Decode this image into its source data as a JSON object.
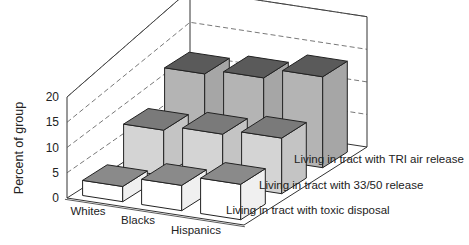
{
  "chart_data": {
    "type": "bar",
    "subtype": "3d-grouped-bar",
    "title": "",
    "xlabel": "",
    "ylabel": "Percent of group",
    "ylim": [
      0,
      20
    ],
    "yticks": [
      "0",
      "5",
      "10",
      "15",
      "20"
    ],
    "grid": true,
    "categories": [
      "Whites",
      "Blacks",
      "Hispanics"
    ],
    "series": [
      {
        "name": "Living in tract with toxic disposal",
        "values": [
          3,
          5,
          7
        ]
      },
      {
        "name": "Living in tract with 33/50 release",
        "values": [
          9,
          10,
          11
        ]
      },
      {
        "name": "Living in tract with TRI air release",
        "values": [
          15,
          16,
          18
        ]
      }
    ],
    "legend_position": "depth-axis labels (right)"
  },
  "colors": {
    "front_face": [
      "#ffffff",
      "#d4d4d4",
      "#b4b4b4"
    ],
    "top_face": [
      "#8a8a8a",
      "#7a7a7a",
      "#5a5a5a"
    ],
    "side_face": [
      "#f0f0f0",
      "#c4c4c4",
      "#a6a6a6"
    ]
  }
}
